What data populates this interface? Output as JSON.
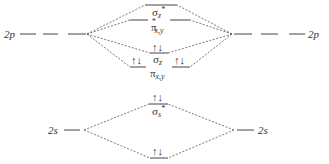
{
  "diagram": {
    "type": "molecular-orbital-diagram",
    "atomic_orbitals": {
      "left_2p": "2p",
      "right_2p": "2p",
      "left_2s": "2s",
      "right_2s": "2s"
    },
    "molecular_orbitals": [
      {
        "id": "sigma_z_star",
        "symbol": "σ",
        "subscript": "z",
        "superscript": "*",
        "electrons": ""
      },
      {
        "id": "pi_xy_star",
        "symbol": "π",
        "subscript": "x,y",
        "superscript": "*",
        "electrons_left": "",
        "electrons_right": ""
      },
      {
        "id": "sigma_z",
        "symbol": "σ",
        "subscript": "z",
        "electrons": "↑↓"
      },
      {
        "id": "pi_xy",
        "symbol": "π",
        "subscript": "x,y",
        "electrons_left": "↑↓",
        "electrons_right": "↑↓"
      },
      {
        "id": "sigma_s_star",
        "symbol": "σ",
        "subscript": "s",
        "superscript": "*",
        "electrons": "↑↓"
      },
      {
        "id": "sigma_s",
        "symbol": "σ",
        "subscript": "s",
        "electrons": "↑↓"
      }
    ]
  }
}
